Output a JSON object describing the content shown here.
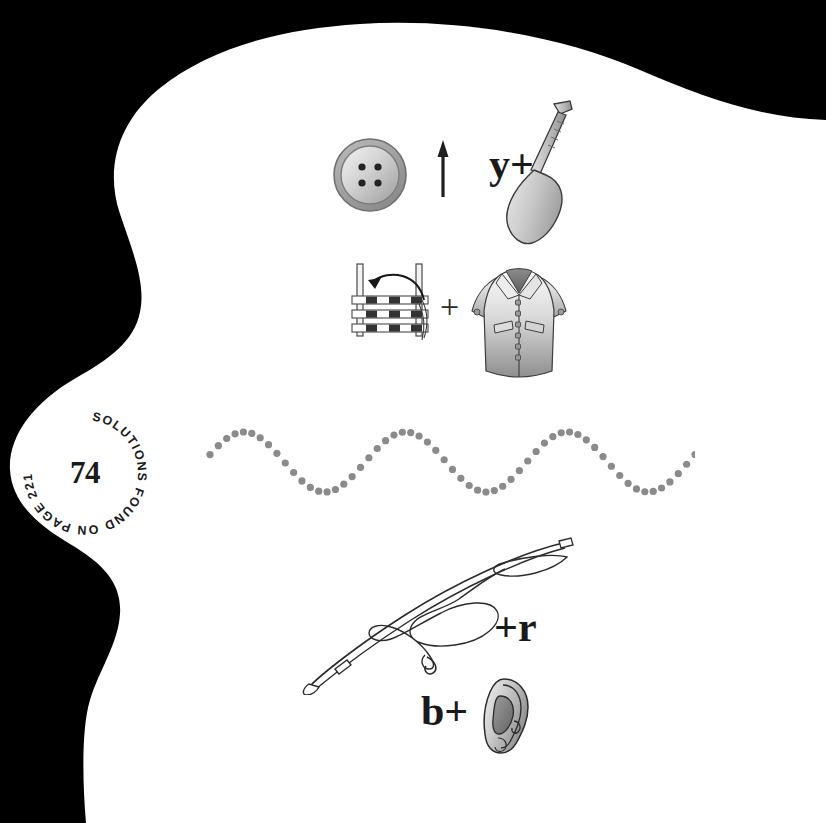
{
  "page": {
    "background_color": "#000000",
    "paper_color": "#ffffff",
    "number": "74",
    "solutions_text": "SOLUTIONS FOUND ON PAGE 221.",
    "ink_color": "#1a1a1a"
  },
  "puzzles": [
    {
      "id": "row-1",
      "elements": [
        {
          "kind": "picture",
          "name": "button-icon",
          "label": "button"
        },
        {
          "kind": "operator",
          "name": "up-arrow-icon",
          "label": "↑"
        },
        {
          "kind": "letters",
          "name": "letters-y-plus",
          "label": "y+"
        },
        {
          "kind": "picture",
          "name": "paddle-icon",
          "label": "paddle"
        }
      ]
    },
    {
      "id": "row-2",
      "elements": [
        {
          "kind": "picture",
          "name": "loom-icon",
          "label": "loom"
        },
        {
          "kind": "operator",
          "name": "plus-sign",
          "label": "+"
        },
        {
          "kind": "picture",
          "name": "coat-icon",
          "label": "coat"
        }
      ]
    },
    {
      "id": "row-3",
      "elements": [
        {
          "kind": "picture",
          "name": "wave-dots",
          "label": "wave"
        }
      ]
    },
    {
      "id": "row-4",
      "elements": [
        {
          "kind": "picture",
          "name": "fishing-rod-icon",
          "label": "fishing rod"
        },
        {
          "kind": "letters",
          "name": "letters-plus-r",
          "label": "+r"
        }
      ]
    },
    {
      "id": "row-5",
      "elements": [
        {
          "kind": "letters",
          "name": "letters-b-plus",
          "label": "b+"
        },
        {
          "kind": "picture",
          "name": "ear-icon",
          "label": "ear"
        }
      ]
    }
  ],
  "wave": {
    "name": "dotted-sine-wave",
    "dot_color": "#8b8b8b",
    "dot_count": 59,
    "peaks": 3,
    "amplitude_px": 30,
    "start_x": 218,
    "end_x": 682,
    "baseline_y": 462
  },
  "colors": {
    "gray_light": "#d8d8d8",
    "gray_mid": "#9a9a9a",
    "gray_dark": "#6e6e6e",
    "outline": "#2b2b2b"
  }
}
